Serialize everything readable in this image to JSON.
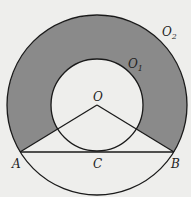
{
  "diagram": {
    "type": "concentric-circles-annulus",
    "colors": {
      "background": "#eeeeec",
      "shade": "#8a8a8a",
      "stroke": "#1a1a1a"
    },
    "points": {
      "O": {
        "label": "O",
        "x": 97,
        "y": 105
      },
      "A": {
        "label": "A",
        "x": 20,
        "y": 152
      },
      "B": {
        "label": "B",
        "x": 174,
        "y": 152
      },
      "C": {
        "label": "C",
        "x": 97,
        "y": 152
      }
    },
    "circles": {
      "outer": {
        "label": "O",
        "sub": "2",
        "r": 90
      },
      "inner": {
        "label": "O",
        "sub": "1",
        "r": 46
      }
    },
    "segments": [
      "OA",
      "OB",
      "AB"
    ],
    "shaded_region": "annular region above OA and OB"
  }
}
